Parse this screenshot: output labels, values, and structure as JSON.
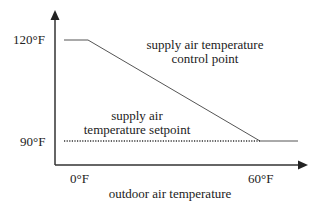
{
  "diagram": {
    "y_axis": {
      "ticks": [
        {
          "label": "120°F",
          "value": 120
        },
        {
          "label": "90°F",
          "value": 90
        }
      ]
    },
    "x_axis": {
      "title": "outdoor air temperature",
      "ticks": [
        {
          "label": "0°F",
          "value": 0
        },
        {
          "label": "60°F",
          "value": 60
        }
      ]
    },
    "curves": {
      "control_point": {
        "label_line1": "supply air temperature",
        "label_line2": "control point",
        "style": "solid",
        "points": [
          [
            -10,
            120
          ],
          [
            0,
            120
          ],
          [
            60,
            90
          ],
          [
            70,
            90
          ]
        ]
      },
      "setpoint": {
        "label_line1": "supply air",
        "label_line2": "temperature setpoint",
        "style": "dotted",
        "value": 90
      }
    },
    "colors": {
      "axis": "#333333",
      "line": "#555555",
      "text": "#222222"
    }
  }
}
